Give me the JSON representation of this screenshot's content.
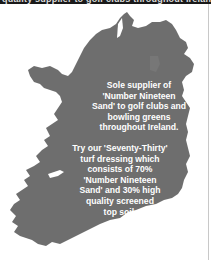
{
  "header": {
    "clipped_text": "quality supplier to golf clubs throughout Ireland"
  },
  "map": {
    "subject": "map-of-ireland",
    "fill_color": "#6e6e6e",
    "text_color": "#ffffff"
  },
  "content": {
    "paragraph_1": "Sole supplier of\n'Number Nineteen\nSand' to golf clubs and\nbowling greens\nthroughout Ireland.",
    "paragraph_2": "Try our 'Seventy-Thirty'\nturf dressing which\nconsists of 70%\n'Number Nineteen\nSand' and 30% high\nquality screened\ntop soil."
  }
}
